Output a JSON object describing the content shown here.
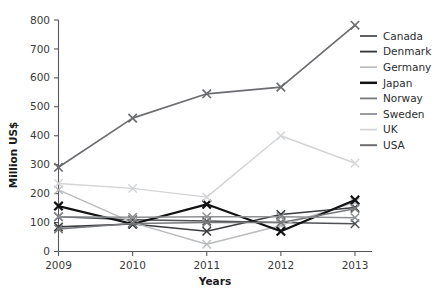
{
  "chart_data": {
    "type": "line",
    "title": "",
    "xlabel": "Years",
    "ylabel": "Million US$",
    "categories": [
      "2009",
      "2010",
      "2011",
      "2012",
      "2013"
    ],
    "x": [
      2009,
      2010,
      2011,
      2012,
      2013
    ],
    "ylim": [
      0,
      800
    ],
    "ytick_labels": [
      "0",
      "100",
      "200",
      "300",
      "400",
      "500",
      "600",
      "700",
      "800"
    ],
    "yticks": [
      0,
      100,
      200,
      300,
      400,
      500,
      600,
      700,
      800
    ],
    "grid": false,
    "legend_position": "right",
    "marker": "x",
    "series": [
      {
        "name": "Canada",
        "color": "#4f5053",
        "width": 1.5,
        "values": [
          120,
          110,
          105,
          100,
          96
        ]
      },
      {
        "name": "Denmark",
        "color": "#3b3c3f",
        "width": 1.6,
        "values": [
          85,
          95,
          70,
          128,
          152
        ]
      },
      {
        "name": "Germany",
        "color": "#b9bbbd",
        "width": 1.4,
        "values": [
          213,
          100,
          25,
          90,
          170
        ]
      },
      {
        "name": "Japan",
        "color": "#121214",
        "width": 2.2,
        "values": [
          157,
          95,
          163,
          70,
          178
        ]
      },
      {
        "name": "Norway",
        "color": "#77797c",
        "width": 1.5,
        "values": [
          78,
          97,
          100,
          100,
          148
        ]
      },
      {
        "name": "Sweden",
        "color": "#8e9093",
        "width": 1.5,
        "values": [
          120,
          118,
          120,
          120,
          117
        ]
      },
      {
        "name": "UK",
        "color": "#d2d4d6",
        "width": 1.4,
        "values": [
          235,
          218,
          188,
          400,
          305
        ]
      },
      {
        "name": "USA",
        "color": "#6b6d70",
        "width": 1.7,
        "values": [
          291,
          461,
          545,
          568,
          782
        ]
      }
    ]
  },
  "axis": {
    "y_title": "Million US$",
    "x_title": "Years"
  },
  "legend": {
    "items": [
      {
        "label": "Canada"
      },
      {
        "label": "Denmark"
      },
      {
        "label": "Germany"
      },
      {
        "label": "Japan"
      },
      {
        "label": "Norway"
      },
      {
        "label": "Sweden"
      },
      {
        "label": "UK"
      },
      {
        "label": "USA"
      }
    ]
  },
  "caption": {
    "text": ""
  }
}
